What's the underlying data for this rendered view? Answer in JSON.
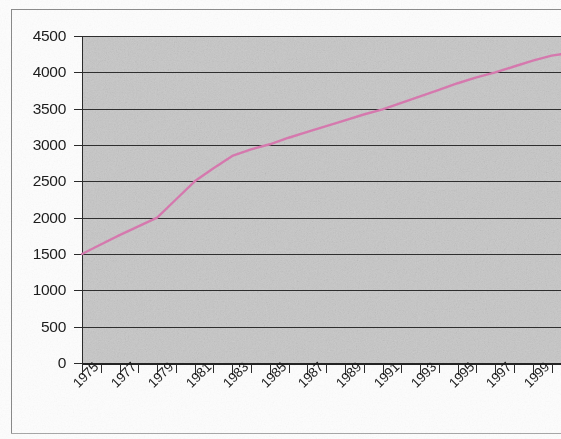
{
  "chart_data": {
    "type": "line",
    "title": "",
    "subtitle": "",
    "xlabel": "",
    "ylabel": "",
    "xlim": [
      1975,
      2000.5
    ],
    "ylim": [
      0,
      4500
    ],
    "grid": true,
    "legend": false,
    "legend_position": "none",
    "plot_background_color": "#c9c9c9",
    "gridline_color": "#2e2e2e",
    "line_color": "#d87ab0",
    "y_ticks": [
      4500,
      4000,
      3500,
      3000,
      2500,
      2000,
      1500,
      1000,
      500,
      0
    ],
    "y_tick_labels": [
      "4500",
      "4000",
      "3500",
      "3000",
      "2500",
      "2000",
      "1500",
      "1000",
      "500",
      "0"
    ],
    "y_tick_interval": 500,
    "x_tick_labels": [
      "1975",
      "1977",
      "1979",
      "1981",
      "1983",
      "1985",
      "1987",
      "1989",
      "1991",
      "1993",
      "1995",
      "1997",
      "1999"
    ],
    "x_tick_label_rotation": -45,
    "x_minor_tick_interval": 1,
    "series": [
      {
        "name": "",
        "x": [
          1975,
          1976,
          1977,
          1978,
          1979,
          1980,
          1981,
          1982,
          1983,
          1984,
          1985,
          1986,
          1987,
          1988,
          1989,
          1990,
          1991,
          1992,
          1993,
          1994,
          1995,
          1996,
          1997,
          1998,
          1999,
          2000,
          2000.5
        ],
        "values": [
          1500,
          1630,
          1760,
          1880,
          2000,
          2250,
          2500,
          2680,
          2850,
          2940,
          3010,
          3100,
          3180,
          3260,
          3340,
          3420,
          3490,
          3580,
          3670,
          3760,
          3850,
          3930,
          4000,
          4080,
          4160,
          4230,
          4250
        ]
      }
    ]
  },
  "axes": {
    "y": {
      "ticks": [
        {
          "label": "4500",
          "value": 4500
        },
        {
          "label": "4000",
          "value": 4000
        },
        {
          "label": "3500",
          "value": 3500
        },
        {
          "label": "3000",
          "value": 3000
        },
        {
          "label": "2500",
          "value": 2500
        },
        {
          "label": "2000",
          "value": 2000
        },
        {
          "label": "1500",
          "value": 1500
        },
        {
          "label": "1000",
          "value": 1000
        },
        {
          "label": "500",
          "value": 500
        },
        {
          "label": "0",
          "value": 0
        }
      ]
    },
    "x": {
      "ticks": [
        {
          "label": "1975",
          "value": 1975
        },
        {
          "label": "1977",
          "value": 1977
        },
        {
          "label": "1979",
          "value": 1979
        },
        {
          "label": "1981",
          "value": 1981
        },
        {
          "label": "1983",
          "value": 1983
        },
        {
          "label": "1985",
          "value": 1985
        },
        {
          "label": "1987",
          "value": 1987
        },
        {
          "label": "1989",
          "value": 1989
        },
        {
          "label": "1991",
          "value": 1991
        },
        {
          "label": "1993",
          "value": 1993
        },
        {
          "label": "1995",
          "value": 1995
        },
        {
          "label": "1997",
          "value": 1997
        },
        {
          "label": "1999",
          "value": 1999
        }
      ],
      "minor_values": [
        1975,
        1976,
        1977,
        1978,
        1979,
        1980,
        1981,
        1982,
        1983,
        1984,
        1985,
        1986,
        1987,
        1988,
        1989,
        1990,
        1991,
        1992,
        1993,
        1994,
        1995,
        1996,
        1997,
        1998,
        1999,
        2000
      ]
    }
  }
}
